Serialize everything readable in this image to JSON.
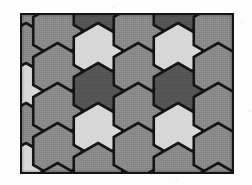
{
  "figure": {
    "frame": {
      "x": 20,
      "y": 13,
      "width": 214,
      "height": 161,
      "border_color": "#141414",
      "border_width": 2,
      "background_color": "#8f8f8f"
    },
    "page_background": "#fdfdfd"
  },
  "palette": {
    "mid_gray": "#8a8a8a",
    "light_gray": "#d8d8d8",
    "dark_gray": "#555555",
    "outline": "#141414"
  },
  "tiling": {
    "type": "hexagonal",
    "orientation": "pointy-top",
    "columns": 5,
    "column_spacing": 47.5,
    "row_spacing": 40,
    "hex_radius": 28,
    "shade_count": 3,
    "cells": [
      {
        "col": 0,
        "row": 0,
        "cx": 4,
        "cy": -4,
        "shade": "mid_gray"
      },
      {
        "col": 0,
        "row": 1,
        "cx": 4,
        "cy": 36,
        "shade": "mid_gray"
      },
      {
        "col": 0,
        "row": 2,
        "cx": 4,
        "cy": 76,
        "shade": "light_gray"
      },
      {
        "col": 0,
        "row": 3,
        "cx": 4,
        "cy": 116,
        "shade": "mid_gray"
      },
      {
        "col": 0,
        "row": 4,
        "cx": 4,
        "cy": 156,
        "shade": "light_gray"
      },
      {
        "col": 1,
        "row": 0,
        "cx": 35.5,
        "cy": 16,
        "shade": "mid_gray"
      },
      {
        "col": 1,
        "row": 1,
        "cx": 35.5,
        "cy": 56,
        "shade": "mid_gray"
      },
      {
        "col": 1,
        "row": 2,
        "cx": 35.5,
        "cy": 96,
        "shade": "mid_gray"
      },
      {
        "col": 1,
        "row": 3,
        "cx": 35.5,
        "cy": 136,
        "shade": "mid_gray"
      },
      {
        "col": 1,
        "row": 4,
        "cx": 35.5,
        "cy": 176,
        "shade": "mid_gray"
      },
      {
        "col": 2,
        "row": 0,
        "cx": 76,
        "cy": -4,
        "shade": "dark_gray"
      },
      {
        "col": 2,
        "row": 1,
        "cx": 76,
        "cy": 36,
        "shade": "light_gray"
      },
      {
        "col": 2,
        "row": 2,
        "cx": 76,
        "cy": 76,
        "shade": "dark_gray"
      },
      {
        "col": 2,
        "row": 3,
        "cx": 76,
        "cy": 116,
        "shade": "light_gray"
      },
      {
        "col": 2,
        "row": 4,
        "cx": 76,
        "cy": 156,
        "shade": "mid_gray"
      },
      {
        "col": 3,
        "row": 0,
        "cx": 116,
        "cy": 16,
        "shade": "mid_gray"
      },
      {
        "col": 3,
        "row": 1,
        "cx": 116,
        "cy": 56,
        "shade": "mid_gray"
      },
      {
        "col": 3,
        "row": 2,
        "cx": 116,
        "cy": 96,
        "shade": "mid_gray"
      },
      {
        "col": 3,
        "row": 3,
        "cx": 116,
        "cy": 136,
        "shade": "mid_gray"
      },
      {
        "col": 4,
        "row": 0,
        "cx": 156,
        "cy": -4,
        "shade": "dark_gray"
      },
      {
        "col": 4,
        "row": 1,
        "cx": 156,
        "cy": 36,
        "shade": "light_gray"
      },
      {
        "col": 4,
        "row": 2,
        "cx": 156,
        "cy": 76,
        "shade": "dark_gray"
      },
      {
        "col": 4,
        "row": 3,
        "cx": 156,
        "cy": 116,
        "shade": "light_gray"
      },
      {
        "col": 4,
        "row": 4,
        "cx": 156,
        "cy": 156,
        "shade": "mid_gray"
      },
      {
        "col": 5,
        "row": 0,
        "cx": 196,
        "cy": 16,
        "shade": "mid_gray"
      },
      {
        "col": 5,
        "row": 1,
        "cx": 196,
        "cy": 56,
        "shade": "mid_gray"
      },
      {
        "col": 5,
        "row": 2,
        "cx": 196,
        "cy": 96,
        "shade": "mid_gray"
      },
      {
        "col": 5,
        "row": 3,
        "cx": 196,
        "cy": 136,
        "shade": "mid_gray"
      },
      {
        "col": 5,
        "row": 4,
        "cx": 196,
        "cy": 176,
        "shade": "mid_gray"
      },
      {
        "col": 6,
        "row": 0,
        "cx": 236,
        "cy": -4,
        "shade": "mid_gray"
      },
      {
        "col": 6,
        "row": 1,
        "cx": 236,
        "cy": 36,
        "shade": "light_gray"
      },
      {
        "col": 6,
        "row": 2,
        "cx": 236,
        "cy": 76,
        "shade": "mid_gray"
      },
      {
        "col": 6,
        "row": 3,
        "cx": 236,
        "cy": 116,
        "shade": "light_gray"
      },
      {
        "col": 6,
        "row": 4,
        "cx": 236,
        "cy": 156,
        "shade": "mid_gray"
      }
    ]
  }
}
